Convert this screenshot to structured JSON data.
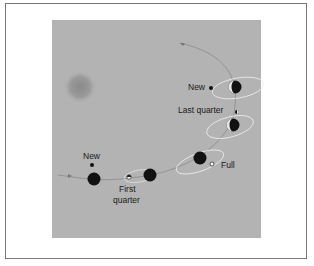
{
  "figure": {
    "labels": {
      "new_top": "New",
      "last_quarter": "Last quarter",
      "full": "Full",
      "new_bottom": "New",
      "first_quarter_line1": "First",
      "first_quarter_line2": "quarter"
    },
    "colors": {
      "background": "#b3b3b3",
      "frame_border": "#777777",
      "orbit_path": "#888888",
      "moon_orbit": "#eeeeee",
      "body": "#111111",
      "sun": "#8c8c8c"
    }
  }
}
